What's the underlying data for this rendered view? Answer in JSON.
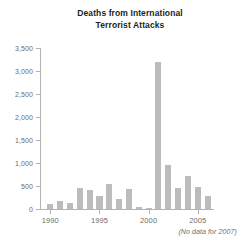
{
  "chart_data": {
    "type": "bar",
    "title": "Deaths from International Terrorist Attacks",
    "title_lines": [
      "Deaths from International",
      "Terrorist Attacks"
    ],
    "xlabel": "",
    "ylabel": "",
    "ylim": [
      0,
      3500
    ],
    "grid": false,
    "legend": null,
    "ytick_labels": [
      "3,500",
      "3,000",
      "2,500",
      "2,000",
      "1,500",
      "1,000",
      "500",
      "0"
    ],
    "ytick_values": [
      3500,
      3000,
      2500,
      2000,
      1500,
      1000,
      500,
      0
    ],
    "xtick_labels": [
      "1990",
      "1995",
      "2000",
      "2005"
    ],
    "xtick_values": [
      1990,
      1995,
      2000,
      2005
    ],
    "categories": [
      "1990",
      "1991",
      "1992",
      "1993",
      "1994",
      "1995",
      "1996",
      "1997",
      "1998",
      "1999",
      "2000",
      "2001",
      "2002",
      "2003",
      "2004",
      "2005",
      "2006"
    ],
    "values": [
      100,
      170,
      125,
      460,
      420,
      290,
      540,
      225,
      440,
      50,
      30,
      3200,
      960,
      460,
      720,
      480,
      290
    ],
    "annotation": "(No data for 2007)",
    "bar_color": "#bcbcbc",
    "axis_color": "#b3b3b3",
    "tick_label_color": "#6d6d6d",
    "title_color": "#231f20",
    "background_color": "#ffffff"
  }
}
